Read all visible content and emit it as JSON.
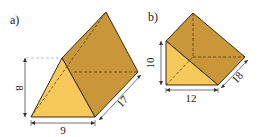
{
  "figures": [
    {
      "label": "a)",
      "shape": "triangular prism",
      "dimensions": {
        "height": "8",
        "base": "9",
        "length": "17"
      }
    },
    {
      "label": "b)",
      "shape": "right triangular prism",
      "dimensions": {
        "height": "10",
        "base": "12",
        "length": "18"
      }
    }
  ],
  "colors": {
    "front_face": "#f7c95a",
    "side_face": "#c9973a",
    "edge": "#3a2a10",
    "dashed": "#5a3e10",
    "dimension_line": "#333333"
  }
}
